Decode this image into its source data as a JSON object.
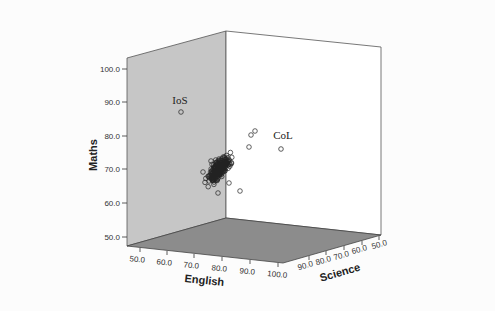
{
  "chart_data": {
    "type": "scatter",
    "subtype": "3d-scatter",
    "title": "",
    "axes": {
      "x": {
        "label": "English",
        "ticks": [
          "50.0",
          "60.0",
          "70.0",
          "80.0",
          "90.0",
          "100.0"
        ],
        "range": [
          50,
          100
        ]
      },
      "y": {
        "label": "Maths",
        "ticks": [
          "50.0",
          "60.0",
          "70.0",
          "80.0",
          "90.0",
          "100.0"
        ],
        "range": [
          50,
          100
        ]
      },
      "z": {
        "label": "Science",
        "ticks": [
          "50.0",
          "60.0",
          "70.0",
          "80.0",
          "90.0"
        ],
        "range": [
          50,
          100
        ]
      }
    },
    "annotations": [
      {
        "label": "IoS",
        "note": "outlier on back-left wall, Maths ≈ 87"
      },
      {
        "label": "CoL",
        "note": "outlier near top right, Maths ≈ 76"
      }
    ],
    "grid": false,
    "legend": null,
    "colors": {
      "left_wall": "#c8c8c8",
      "right_wall": "#ffffff",
      "floor": "#8e8e8e",
      "points": "#000000"
    }
  },
  "labels": {
    "maths": "Maths",
    "english": "English",
    "science": "Science",
    "ios": "IoS",
    "col": "CoL",
    "maths_ticks": [
      "100.0",
      "90.0",
      "80.0",
      "70.0",
      "60.0",
      "50.0"
    ],
    "english_ticks": [
      "50.0",
      "60.0",
      "70.0",
      "80.0",
      "90.0",
      "100.0"
    ],
    "science_ticks": [
      "90.0",
      "80.0",
      "70.0",
      "60.0",
      "50.0"
    ]
  }
}
